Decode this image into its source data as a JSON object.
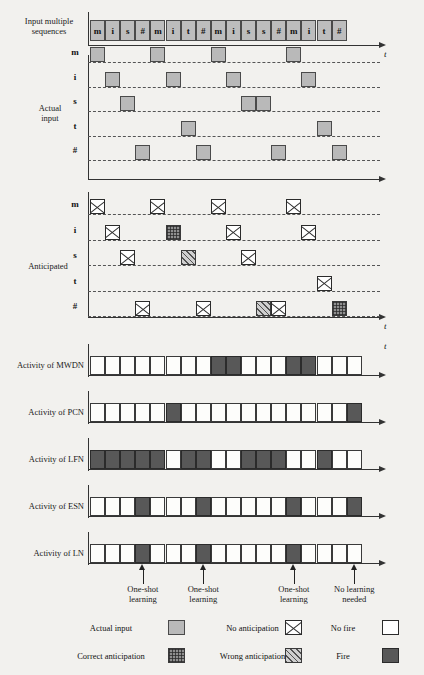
{
  "figure": {
    "sequence_label_line1": "Input multiple",
    "sequence_label_line2": "sequences",
    "time_axis_label": "t",
    "actual_input_label_line1": "Actual",
    "actual_input_label_line2": "input",
    "anticipated_label": "Anticipated"
  },
  "input_sequence": {
    "cells": [
      "m",
      "i",
      "s",
      "#",
      "m",
      "i",
      "t",
      "#",
      "m",
      "i",
      "s",
      "s",
      "#",
      "m",
      "i",
      "t",
      "#"
    ]
  },
  "raster_rows": [
    "m",
    "i",
    "s",
    "t",
    "#"
  ],
  "actual_input": {
    "caption": "Actual input",
    "row_m": [
      1,
      5,
      9,
      14
    ],
    "row_i": [
      2,
      6,
      10,
      15
    ],
    "row_s": [
      3,
      11,
      12
    ],
    "row_t": [
      7,
      16
    ],
    "row_hash": [
      4,
      8,
      13,
      17
    ]
  },
  "anticipated": {
    "caption": "Anticipated",
    "row_m": [
      {
        "col": 1,
        "type": "no-anticipation"
      },
      {
        "col": 5,
        "type": "no-anticipation"
      },
      {
        "col": 9,
        "type": "no-anticipation"
      },
      {
        "col": 14,
        "type": "no-anticipation"
      }
    ],
    "row_i": [
      {
        "col": 2,
        "type": "no-anticipation"
      },
      {
        "col": 6,
        "type": "correct-anticipation"
      },
      {
        "col": 10,
        "type": "no-anticipation"
      },
      {
        "col": 15,
        "type": "no-anticipation"
      }
    ],
    "row_s": [
      {
        "col": 3,
        "type": "no-anticipation"
      },
      {
        "col": 7,
        "type": "wrong-anticipation"
      },
      {
        "col": 11,
        "type": "no-anticipation"
      }
    ],
    "row_t": [
      {
        "col": 16,
        "type": "no-anticipation"
      }
    ],
    "row_hash": [
      {
        "col": 4,
        "type": "no-anticipation"
      },
      {
        "col": 8,
        "type": "no-anticipation"
      },
      {
        "col": 12,
        "type": "wrong-anticipation"
      },
      {
        "col": 13,
        "type": "no-anticipation"
      },
      {
        "col": 17,
        "type": "correct-anticipation"
      }
    ]
  },
  "activity": [
    {
      "label": "Activity of MWDN",
      "name": "mwdn",
      "states": [
        "no-fire",
        "no-fire",
        "no-fire",
        "no-fire",
        "no-fire",
        "no-fire",
        "no-fire",
        "no-fire",
        "fire",
        "fire",
        "no-fire",
        "no-fire",
        "no-fire",
        "fire",
        "fire",
        "no-fire",
        "no-fire",
        "no-fire"
      ]
    },
    {
      "label": "Activity of PCN",
      "name": "pcn",
      "states": [
        "no-fire",
        "no-fire",
        "no-fire",
        "no-fire",
        "no-fire",
        "fire",
        "no-fire",
        "no-fire",
        "no-fire",
        "no-fire",
        "no-fire",
        "no-fire",
        "no-fire",
        "no-fire",
        "no-fire",
        "no-fire",
        "no-fire",
        "fire"
      ]
    },
    {
      "label": "Activity of LFN",
      "name": "lfn",
      "states": [
        "fire",
        "fire",
        "fire",
        "fire",
        "fire",
        "no-fire",
        "fire",
        "fire",
        "no-fire",
        "no-fire",
        "fire",
        "fire",
        "fire",
        "no-fire",
        "no-fire",
        "fire",
        "no-fire",
        "no-fire"
      ]
    },
    {
      "label": "Activity of ESN",
      "name": "esn",
      "states": [
        "no-fire",
        "no-fire",
        "no-fire",
        "fire",
        "no-fire",
        "no-fire",
        "no-fire",
        "fire",
        "no-fire",
        "no-fire",
        "no-fire",
        "no-fire",
        "no-fire",
        "fire",
        "no-fire",
        "no-fire",
        "no-fire",
        "fire"
      ]
    },
    {
      "label": "Activity of LN",
      "name": "ln",
      "states": [
        "no-fire",
        "no-fire",
        "no-fire",
        "fire",
        "no-fire",
        "no-fire",
        "no-fire",
        "fire",
        "no-fire",
        "no-fire",
        "no-fire",
        "no-fire",
        "no-fire",
        "fire",
        "no-fire",
        "no-fire",
        "no-fire",
        "no-fire"
      ]
    }
  ],
  "annotations": [
    {
      "col": 4,
      "line1": "One-shot",
      "line2": "learning"
    },
    {
      "col": 8,
      "line1": "One-shot",
      "line2": "learning"
    },
    {
      "col": 14,
      "line1": "One-shot",
      "line2": "learning"
    },
    {
      "col": 18,
      "line1": "No learning",
      "line2": "needed"
    }
  ],
  "legend": [
    {
      "label": "Actual input",
      "swatch": "actual-input"
    },
    {
      "label": "No anticipation",
      "swatch": "no-anticipation"
    },
    {
      "label": "No fire",
      "swatch": "no-fire"
    },
    {
      "label": "Correct anticipation",
      "swatch": "correct-anticipation"
    },
    {
      "label": "Wrong anticipation",
      "swatch": "wrong-anticipation"
    },
    {
      "label": "Fire",
      "swatch": "fire"
    }
  ],
  "colors": {
    "input_gray": "#b9b9b9",
    "fire_dark": "#585858",
    "axis": "#333333",
    "background": "#f2f1ee"
  }
}
